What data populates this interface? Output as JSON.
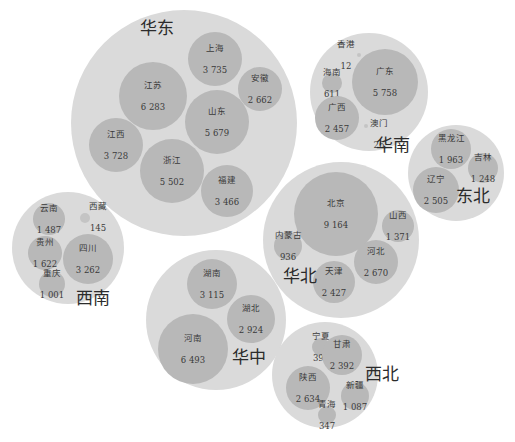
{
  "chart_data": {
    "type": "bubble",
    "title": "",
    "regions": [
      {
        "name": "华东",
        "circle": {
          "cx": 184,
          "cy": 123,
          "r": 113
        },
        "label_pos": {
          "x": 140,
          "y": 14
        },
        "provinces": [
          {
            "name": "上海",
            "value": "3 735",
            "cx": 215,
            "cy": 59,
            "r": 27
          },
          {
            "name": "安徽",
            "value": "2 662",
            "cx": 260,
            "cy": 89,
            "r": 22
          },
          {
            "name": "江苏",
            "value": "6 283",
            "cx": 153,
            "cy": 96,
            "r": 34
          },
          {
            "name": "山东",
            "value": "5 679",
            "cx": 217,
            "cy": 122,
            "r": 32
          },
          {
            "name": "江西",
            "value": "3 728",
            "cx": 116,
            "cy": 145,
            "r": 27
          },
          {
            "name": "浙江",
            "value": "5 502",
            "cx": 172,
            "cy": 171,
            "r": 32
          },
          {
            "name": "福建",
            "value": "3 466",
            "cx": 227,
            "cy": 191,
            "r": 26
          }
        ]
      },
      {
        "name": "华南",
        "circle": {
          "cx": 369,
          "cy": 92,
          "r": 59
        },
        "label_pos": {
          "x": 376,
          "y": 131
        },
        "provinces": [
          {
            "name": "香港",
            "value": "12",
            "cx": 359,
            "cy": 55,
            "r": 2,
            "label_outside": {
              "x": 337,
              "y": 39
            }
          },
          {
            "name": "广东",
            "value": "5 758",
            "cx": 385,
            "cy": 82,
            "r": 33
          },
          {
            "name": "海南",
            "value": "611",
            "cx": 332,
            "cy": 83,
            "r": 10
          },
          {
            "name": "广西",
            "value": "2 457",
            "cx": 337,
            "cy": 118,
            "r": 22
          },
          {
            "name": "澳门",
            "value": "26",
            "cx": 366,
            "cy": 126,
            "r": 2,
            "label_outside": {
              "x": 370,
              "y": 118
            }
          }
        ]
      },
      {
        "name": "东北",
        "circle": {
          "cx": 456,
          "cy": 173,
          "r": 48
        },
        "label_pos": {
          "x": 456,
          "y": 182
        },
        "provinces": [
          {
            "name": "黑龙江",
            "value": "1 963",
            "cx": 451,
            "cy": 149,
            "r": 20
          },
          {
            "name": "吉林",
            "value": "1 248",
            "cx": 483,
            "cy": 168,
            "r": 15
          },
          {
            "name": "辽宁",
            "value": "2 505",
            "cx": 436,
            "cy": 190,
            "r": 23
          }
        ]
      },
      {
        "name": "华北",
        "circle": {
          "cx": 341,
          "cy": 240,
          "r": 78
        },
        "label_pos": {
          "x": 283,
          "y": 262
        },
        "provinces": [
          {
            "name": "北京",
            "value": "9 164",
            "cx": 336,
            "cy": 214,
            "r": 42
          },
          {
            "name": "山西",
            "value": "1 371",
            "cx": 398,
            "cy": 226,
            "r": 16
          },
          {
            "name": "内蒙古",
            "value": "936",
            "cx": 288,
            "cy": 246,
            "r": 14
          },
          {
            "name": "河北",
            "value": "2 670",
            "cx": 376,
            "cy": 262,
            "r": 22
          },
          {
            "name": "天津",
            "value": "2 427",
            "cx": 334,
            "cy": 282,
            "r": 21
          }
        ]
      },
      {
        "name": "西南",
        "circle": {
          "cx": 68,
          "cy": 248,
          "r": 56
        },
        "label_pos": {
          "x": 76,
          "y": 284
        },
        "provinces": [
          {
            "name": "云南",
            "value": "1 487",
            "cx": 49,
            "cy": 219,
            "r": 16
          },
          {
            "name": "西藏",
            "value": "145",
            "cx": 85,
            "cy": 218,
            "r": 5,
            "label_outside": {
              "x": 89,
              "y": 201
            }
          },
          {
            "name": "贵州",
            "value": "1 622",
            "cx": 45,
            "cy": 253,
            "r": 17
          },
          {
            "name": "四川",
            "value": "3 262",
            "cx": 88,
            "cy": 259,
            "r": 25
          },
          {
            "name": "重庆",
            "value": "1 001",
            "cx": 52,
            "cy": 284,
            "r": 13
          }
        ]
      },
      {
        "name": "华中",
        "circle": {
          "cx": 216,
          "cy": 320,
          "r": 70
        },
        "label_pos": {
          "x": 232,
          "y": 343
        },
        "provinces": [
          {
            "name": "湖南",
            "value": "3 115",
            "cx": 212,
            "cy": 284,
            "r": 25
          },
          {
            "name": "湖北",
            "value": "2 924",
            "cx": 251,
            "cy": 319,
            "r": 24
          },
          {
            "name": "河南",
            "value": "6 493",
            "cx": 193,
            "cy": 349,
            "r": 35
          }
        ]
      },
      {
        "name": "西北",
        "circle": {
          "cx": 325,
          "cy": 375,
          "r": 53
        },
        "label_pos": {
          "x": 365,
          "y": 360
        },
        "provinces": [
          {
            "name": "宁夏",
            "value": "398",
            "cx": 321,
            "cy": 347,
            "r": 9
          },
          {
            "name": "甘肃",
            "value": "2 392",
            "cx": 342,
            "cy": 355,
            "r": 20
          },
          {
            "name": "陕西",
            "value": "2 634",
            "cx": 308,
            "cy": 388,
            "r": 22
          },
          {
            "name": "新疆",
            "value": "1 087",
            "cx": 355,
            "cy": 396,
            "r": 14
          },
          {
            "name": "青海",
            "value": "347",
            "cx": 327,
            "cy": 415,
            "r": 9
          }
        ]
      }
    ],
    "legend": null,
    "colors": {
      "region_fill": "#dadada",
      "province_fill": "#b8b8b8",
      "text": "#3a3a3a"
    }
  }
}
